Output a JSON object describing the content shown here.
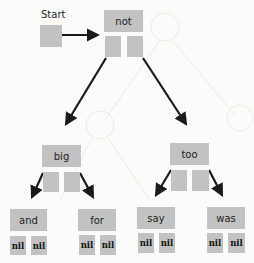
{
  "diagram": {
    "type": "binary-tree",
    "start_label": "Start",
    "colors": {
      "box": "#c2c2c2",
      "arrow": "#1a1a1a",
      "background": "#fbfbf9"
    },
    "root": {
      "label": "not",
      "left": {
        "label": "big",
        "left": {
          "label": "and",
          "left": "nil",
          "right": "nil"
        },
        "right": {
          "label": "for",
          "left": "nil",
          "right": "nil"
        }
      },
      "right": {
        "label": "too",
        "left": {
          "label": "say",
          "left": "nil",
          "right": "nil"
        },
        "right": {
          "label": "was",
          "left": "nil",
          "right": "nil"
        }
      }
    }
  }
}
